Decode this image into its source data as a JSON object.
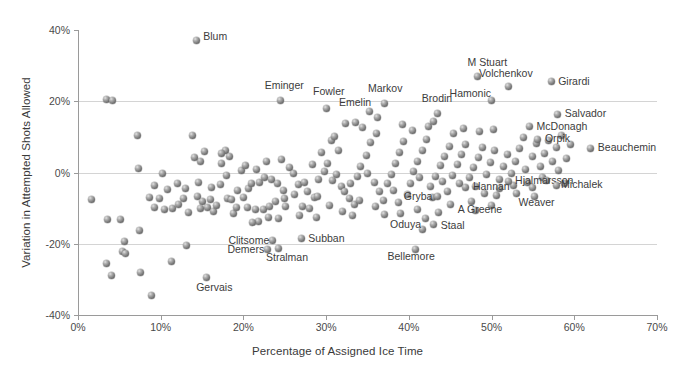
{
  "chart_data": {
    "type": "scatter",
    "title": "",
    "xlabel": "Percentage of Assigned Ice Time",
    "ylabel": "Variation in Attempted Shots Allowed",
    "xlim": [
      0,
      70
    ],
    "ylim": [
      -40,
      40
    ],
    "xticks": [
      "0%",
      "10%",
      "20%",
      "30%",
      "40%",
      "50%",
      "60%",
      "70%"
    ],
    "xtick_values": [
      0,
      10,
      20,
      30,
      40,
      50,
      60,
      70
    ],
    "yticks": [
      "40%",
      "20%",
      "0%",
      "-20%",
      "-40%"
    ],
    "ytick_values": [
      40,
      20,
      0,
      -20,
      -40
    ],
    "grid": "horizontal",
    "legend": "none",
    "marker_style": "3d-sphere-gray",
    "marker_color": "#7d7d7d",
    "axis_color": "#9a9a9a",
    "gridline_color": "#d4d4d4",
    "labeled_points": [
      {
        "name": "Blum",
        "x": 14.3,
        "y": 37.0,
        "lx": 7,
        "ly": -5
      },
      {
        "name": "Eminger",
        "x": 24.5,
        "y": 20.2,
        "lx": -16,
        "ly": -16
      },
      {
        "name": "Fowler",
        "x": 30.1,
        "y": 18.0,
        "lx": -14,
        "ly": -17
      },
      {
        "name": "Emelin",
        "x": 32.4,
        "y": 13.7,
        "lx": -7,
        "ly": -22
      },
      {
        "name": "Markov",
        "x": 37.0,
        "y": 19.3,
        "lx": -16,
        "ly": -16
      },
      {
        "name": "Brodin",
        "x": 43.5,
        "y": 16.5,
        "lx": -16,
        "ly": -16
      },
      {
        "name": "M Stuart",
        "x": 48.3,
        "y": 26.9,
        "lx": -10,
        "ly": -15
      },
      {
        "name": "Hamonic",
        "x": 50.0,
        "y": 20.1,
        "lx": -42,
        "ly": -8
      },
      {
        "name": "Volchenkov",
        "x": 52.1,
        "y": 24.1,
        "lx": -30,
        "ly": -14
      },
      {
        "name": "Girardi",
        "x": 57.2,
        "y": 25.5,
        "lx": 7,
        "ly": -1
      },
      {
        "name": "Salvador",
        "x": 58.0,
        "y": 16.3,
        "lx": 7,
        "ly": -1
      },
      {
        "name": "McDonagh",
        "x": 54.6,
        "y": 12.9,
        "lx": 7,
        "ly": -1
      },
      {
        "name": "Orpik",
        "x": 55.6,
        "y": 9.4,
        "lx": 7,
        "ly": -1
      },
      {
        "name": "Beauchemin",
        "x": 62.0,
        "y": 6.8,
        "lx": 7,
        "ly": -1
      },
      {
        "name": "Hjalmarsson",
        "x": 52.0,
        "y": -2.5,
        "lx": 7,
        "ly": -1
      },
      {
        "name": "Michalek",
        "x": 57.8,
        "y": -3.6,
        "lx": 5,
        "ly": -1
      },
      {
        "name": "Weaver",
        "x": 55.2,
        "y": -6.6,
        "lx": -16,
        "ly": 6
      },
      {
        "name": "Hannan",
        "x": 46.9,
        "y": -4.1,
        "lx": 7,
        "ly": -1
      },
      {
        "name": "A Greene",
        "x": 47.6,
        "y": -8.2,
        "lx": -14,
        "ly": 7
      },
      {
        "name": "Gryba",
        "x": 43.5,
        "y": -6.6,
        "lx": -34,
        "ly": 0
      },
      {
        "name": "Staal",
        "x": 43.0,
        "y": -14.6,
        "lx": 7,
        "ly": 0
      },
      {
        "name": "Oduya",
        "x": 41.6,
        "y": -15.9,
        "lx": -32,
        "ly": -5
      },
      {
        "name": "Bellemore",
        "x": 40.8,
        "y": -21.5,
        "lx": -28,
        "ly": 7
      },
      {
        "name": "Subban",
        "x": 27.0,
        "y": -18.6,
        "lx": 7,
        "ly": -1
      },
      {
        "name": "Clitsome",
        "x": 23.5,
        "y": -19.0,
        "lx": -44,
        "ly": 0
      },
      {
        "name": "Demers",
        "x": 22.9,
        "y": -21.6,
        "lx": -40,
        "ly": 0
      },
      {
        "name": "Stralman",
        "x": 24.3,
        "y": -21.3,
        "lx": -13,
        "ly": 9
      },
      {
        "name": "Gervais",
        "x": 15.5,
        "y": -29.4,
        "lx": -10,
        "ly": 10
      }
    ],
    "unlabeled_points": [
      [
        3.4,
        20.4
      ],
      [
        4.2,
        20.1
      ],
      [
        7.2,
        10.5
      ],
      [
        7.3,
        1.2
      ],
      [
        1.6,
        -7.6
      ],
      [
        3.6,
        -13.2
      ],
      [
        5.1,
        -13.2
      ],
      [
        7.4,
        -16.4
      ],
      [
        5.6,
        -19.5
      ],
      [
        5.4,
        -22.2
      ],
      [
        5.8,
        -22.8
      ],
      [
        3.4,
        -25.6
      ],
      [
        4.1,
        -28.8
      ],
      [
        7.5,
        -28.2
      ],
      [
        8.9,
        -34.6
      ],
      [
        10.2,
        -0.3
      ],
      [
        9.3,
        -3.6
      ],
      [
        9.8,
        -7.2
      ],
      [
        9.2,
        -9.8
      ],
      [
        10.4,
        -10.4
      ],
      [
        11.4,
        -10.2
      ],
      [
        11.3,
        -25.0
      ],
      [
        13.1,
        -20.6
      ],
      [
        13.9,
        10.4
      ],
      [
        14.8,
        3.2
      ],
      [
        14.1,
        4.3
      ],
      [
        15.3,
        5.9
      ],
      [
        14.6,
        -2.7
      ],
      [
        14.4,
        -6.6
      ],
      [
        15.1,
        -8.0
      ],
      [
        15.6,
        -9.8
      ],
      [
        14.8,
        -10.1
      ],
      [
        16.0,
        -7.6
      ],
      [
        16.4,
        -11.0
      ],
      [
        17.3,
        2.4
      ],
      [
        17.8,
        6.3
      ],
      [
        17.4,
        5.2
      ],
      [
        18.3,
        4.6
      ],
      [
        17.9,
        -0.9
      ],
      [
        17.2,
        -3.4
      ],
      [
        18.1,
        -7.2
      ],
      [
        18.6,
        -7.6
      ],
      [
        19.3,
        -5.1
      ],
      [
        20.0,
        -7.1
      ],
      [
        20.6,
        -4.5
      ],
      [
        21.0,
        -3.1
      ],
      [
        20.5,
        -9.9
      ],
      [
        21.4,
        -10.3
      ],
      [
        21.8,
        -13.7
      ],
      [
        21.1,
        -14.1
      ],
      [
        22.4,
        -10.3
      ],
      [
        23.1,
        -9.6
      ],
      [
        22.0,
        -2.9
      ],
      [
        22.6,
        -1.5
      ],
      [
        23.4,
        -1.9
      ],
      [
        24.1,
        -3.2
      ],
      [
        24.8,
        -5.1
      ],
      [
        23.9,
        -8.0
      ],
      [
        25.1,
        -9.5
      ],
      [
        25.6,
        1.4
      ],
      [
        24.6,
        3.7
      ],
      [
        26.0,
        -0.2
      ],
      [
        26.6,
        -3.4
      ],
      [
        27.4,
        -2.9
      ],
      [
        28.0,
        -10.0
      ],
      [
        27.2,
        -9.5
      ],
      [
        28.6,
        -7.0
      ],
      [
        29.1,
        -2.1
      ],
      [
        29.8,
        0.3
      ],
      [
        28.3,
        2.2
      ],
      [
        29.4,
        5.6
      ],
      [
        30.6,
        8.9
      ],
      [
        31.0,
        10.2
      ],
      [
        31.5,
        6.1
      ],
      [
        30.2,
        2.6
      ],
      [
        31.2,
        -0.5
      ],
      [
        30.8,
        -2.2
      ],
      [
        31.9,
        -3.9
      ],
      [
        32.2,
        -5.4
      ],
      [
        32.8,
        -7.4
      ],
      [
        33.4,
        -9.0
      ],
      [
        33.0,
        -3.0
      ],
      [
        33.8,
        -1.0
      ],
      [
        34.2,
        1.8
      ],
      [
        34.9,
        4.9
      ],
      [
        35.4,
        8.3
      ],
      [
        36.1,
        10.9
      ],
      [
        35.0,
        -0.4
      ],
      [
        35.8,
        -2.7
      ],
      [
        36.4,
        -5.2
      ],
      [
        36.9,
        -7.8
      ],
      [
        37.4,
        -3.2
      ],
      [
        37.9,
        -0.7
      ],
      [
        38.4,
        2.5
      ],
      [
        38.9,
        5.7
      ],
      [
        39.4,
        8.8
      ],
      [
        38.1,
        -5.0
      ],
      [
        38.7,
        -8.3
      ],
      [
        39.8,
        -6.1
      ],
      [
        40.2,
        -3.0
      ],
      [
        40.6,
        0.4
      ],
      [
        41.1,
        3.2
      ],
      [
        41.6,
        6.2
      ],
      [
        42.1,
        9.2
      ],
      [
        41.3,
        -1.4
      ],
      [
        42.6,
        -4.0
      ],
      [
        42.9,
        -7.0
      ],
      [
        43.2,
        -1.2
      ],
      [
        43.8,
        1.9
      ],
      [
        44.3,
        4.6
      ],
      [
        44.9,
        7.4
      ],
      [
        44.1,
        -2.6
      ],
      [
        44.7,
        -5.4
      ],
      [
        45.3,
        -0.8
      ],
      [
        45.9,
        2.3
      ],
      [
        46.4,
        5.1
      ],
      [
        46.9,
        8.0
      ],
      [
        46.1,
        -3.2
      ],
      [
        47.3,
        -1.5
      ],
      [
        47.8,
        1.4
      ],
      [
        48.4,
        4.1
      ],
      [
        48.9,
        7.0
      ],
      [
        48.1,
        -3.8
      ],
      [
        49.4,
        -0.5
      ],
      [
        49.9,
        2.9
      ],
      [
        50.4,
        6.1
      ],
      [
        49.1,
        -5.8
      ],
      [
        50.9,
        -1.9
      ],
      [
        51.4,
        1.7
      ],
      [
        51.9,
        5.0
      ],
      [
        50.6,
        -6.4
      ],
      [
        52.4,
        -0.3
      ],
      [
        52.9,
        3.2
      ],
      [
        53.4,
        6.8
      ],
      [
        53.9,
        9.7
      ],
      [
        52.6,
        -3.7
      ],
      [
        54.1,
        0.9
      ],
      [
        54.9,
        4.4
      ],
      [
        55.4,
        8.2
      ],
      [
        54.4,
        -2.8
      ],
      [
        55.9,
        1.6
      ],
      [
        56.4,
        5.4
      ],
      [
        56.9,
        9.0
      ],
      [
        56.1,
        -1.4
      ],
      [
        57.4,
        3.1
      ],
      [
        57.9,
        7.0
      ],
      [
        58.4,
        10.3
      ],
      [
        58.1,
        0.6
      ],
      [
        59.0,
        4.0
      ],
      [
        59.5,
        7.8
      ],
      [
        33.6,
        14.0
      ],
      [
        34.4,
        12.6
      ],
      [
        35.2,
        17.2
      ],
      [
        36.2,
        15.4
      ],
      [
        39.2,
        13.5
      ],
      [
        40.4,
        11.8
      ],
      [
        42.4,
        12.8
      ],
      [
        43.0,
        14.2
      ],
      [
        45.4,
        11.0
      ],
      [
        46.6,
        12.4
      ],
      [
        48.6,
        11.6
      ],
      [
        50.2,
        12.2
      ],
      [
        19.8,
        0.5
      ],
      [
        20.2,
        2.1
      ],
      [
        21.6,
        0.9
      ],
      [
        22.8,
        3.0
      ],
      [
        25.0,
        -7.4
      ],
      [
        26.2,
        -6.2
      ],
      [
        27.8,
        -5.4
      ],
      [
        29.0,
        -6.8
      ],
      [
        30.4,
        -9.2
      ],
      [
        32.0,
        -11.0
      ],
      [
        33.2,
        -12.2
      ],
      [
        12.2,
        -9.0
      ],
      [
        12.8,
        -7.4
      ],
      [
        13.4,
        -11.2
      ],
      [
        16.8,
        -9.2
      ],
      [
        18.8,
        -11.4
      ],
      [
        19.2,
        -9.8
      ],
      [
        23.0,
        -12.5
      ],
      [
        24.2,
        -13.0
      ],
      [
        26.8,
        -12.0
      ],
      [
        28.8,
        -12.6
      ],
      [
        41.0,
        -10.5
      ],
      [
        39.0,
        -11.5
      ],
      [
        37.0,
        -11.8
      ],
      [
        34.0,
        -7.8
      ],
      [
        36.0,
        -9.6
      ],
      [
        8.6,
        -7.0
      ],
      [
        10.8,
        -4.8
      ],
      [
        12.0,
        -3.2
      ],
      [
        13.0,
        -4.6
      ],
      [
        16.2,
        -4.2
      ],
      [
        45.0,
        -9.0
      ],
      [
        43.6,
        -11.2
      ],
      [
        42.0,
        -12.8
      ],
      [
        51.0,
        -4.6
      ],
      [
        53.0,
        -6.0
      ],
      [
        55.0,
        -4.2
      ],
      [
        56.6,
        -2.2
      ],
      [
        58.8,
        -3.0
      ],
      [
        50.0,
        -9.4
      ],
      [
        48.0,
        -10.6
      ]
    ]
  }
}
